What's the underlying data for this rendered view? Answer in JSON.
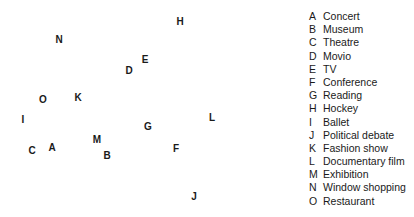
{
  "chart_data": {
    "type": "scatter",
    "title": "",
    "xlabel": "",
    "ylabel": "",
    "grid": false,
    "legend_position": "right",
    "points": [
      {
        "key": "A",
        "label": "Concert",
        "x": 52,
        "y": 148
      },
      {
        "key": "B",
        "label": "Museum",
        "x": 107,
        "y": 156
      },
      {
        "key": "C",
        "label": "Theatre",
        "x": 32,
        "y": 151
      },
      {
        "key": "D",
        "label": "Movio",
        "x": 129,
        "y": 71
      },
      {
        "key": "E",
        "label": "TV",
        "x": 145,
        "y": 60
      },
      {
        "key": "F",
        "label": "Conference",
        "x": 176,
        "y": 149
      },
      {
        "key": "G",
        "label": "Reading",
        "x": 148,
        "y": 127
      },
      {
        "key": "H",
        "label": "Hockey",
        "x": 180,
        "y": 22
      },
      {
        "key": "I",
        "label": "Ballet",
        "x": 23,
        "y": 120
      },
      {
        "key": "J",
        "label": "Political debate",
        "x": 194,
        "y": 197
      },
      {
        "key": "K",
        "label": "Fashion show",
        "x": 78,
        "y": 98
      },
      {
        "key": "L",
        "label": "Documentary film",
        "x": 212,
        "y": 118
      },
      {
        "key": "M",
        "label": "Exhibition",
        "x": 97,
        "y": 140
      },
      {
        "key": "N",
        "label": "Window shopping",
        "x": 59,
        "y": 40
      },
      {
        "key": "O",
        "label": "Restaurant",
        "x": 43,
        "y": 100
      }
    ]
  },
  "legend": [
    {
      "key": "A",
      "label": "Concert"
    },
    {
      "key": "B",
      "label": "Museum"
    },
    {
      "key": "C",
      "label": "Theatre"
    },
    {
      "key": "D",
      "label": "Movio"
    },
    {
      "key": "E",
      "label": "TV"
    },
    {
      "key": "F",
      "label": "Conference"
    },
    {
      "key": "G",
      "label": "Reading"
    },
    {
      "key": "H",
      "label": "Hockey"
    },
    {
      "key": "I",
      "label": "Ballet"
    },
    {
      "key": "J",
      "label": "Political debate"
    },
    {
      "key": "K",
      "label": "Fashion show"
    },
    {
      "key": "L",
      "label": "Documentary film"
    },
    {
      "key": "M",
      "label": "Exhibition"
    },
    {
      "key": "N",
      "label": "Window shopping"
    },
    {
      "key": "O",
      "label": "Restaurant"
    }
  ]
}
